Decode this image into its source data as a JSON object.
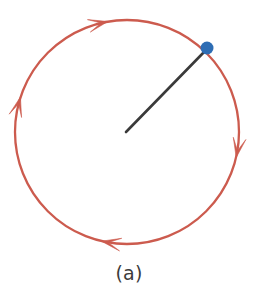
{
  "figure": {
    "caption": "(a)",
    "background_color": "#ffffff",
    "width": 258,
    "height": 301
  },
  "diagram": {
    "type": "circular-motion-schematic",
    "circle": {
      "name": "orbit-path",
      "center_x": 127,
      "center_y": 132,
      "radius": 112,
      "stroke_color": "#cc5b4e",
      "stroke_width": 2.3,
      "direction": "clockwise"
    },
    "radius_line": {
      "name": "radius-vector",
      "x1": 126,
      "y1": 132,
      "x2": 206,
      "y2": 50,
      "stroke_color": "#3a3a3a",
      "stroke_width": 2.6,
      "angle_degrees": 45.7
    },
    "particle": {
      "name": "particle-dot",
      "cx": 207,
      "cy": 48,
      "r": 6.5,
      "fill_color": "#2e6db4"
    },
    "arrows": [
      {
        "name": "arrow-top",
        "position_degrees": 103,
        "tip_x": 158,
        "tip_y": 19,
        "points": "right",
        "color": "#cc5b4e"
      },
      {
        "name": "arrow-right",
        "position_degrees": 350,
        "tip_x": 239,
        "tip_y": 155,
        "points": "down",
        "color": "#cc5b4e"
      },
      {
        "name": "arrow-bottom",
        "position_degrees": 260,
        "tip_x": 103,
        "tip_y": 243,
        "points": "left",
        "color": "#cc5b4e"
      },
      {
        "name": "arrow-left",
        "position_degrees": 165,
        "tip_x": 18,
        "tip_y": 97,
        "points": "up",
        "color": "#cc5b4e"
      }
    ]
  },
  "colors": {
    "path_red": "#cc5b4e",
    "particle_blue": "#2e6db4",
    "line_dark": "#3a3a3a",
    "caption_gray": "#3b3b3b",
    "background": "#ffffff"
  }
}
